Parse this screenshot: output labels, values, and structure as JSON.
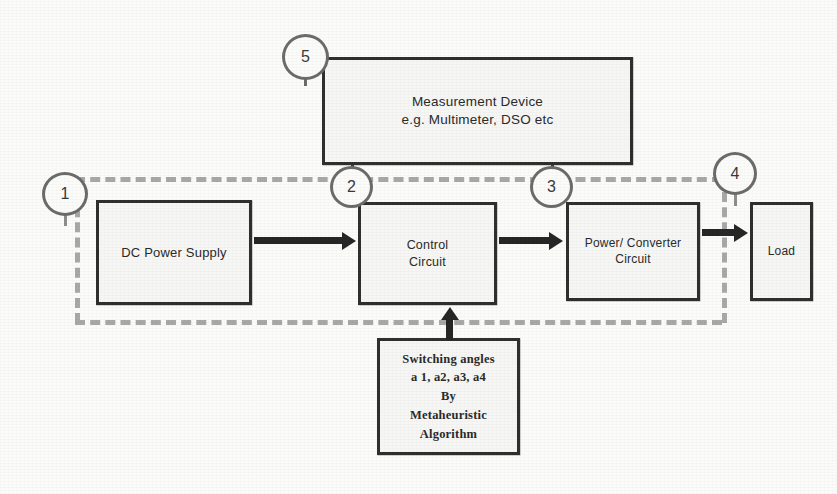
{
  "diagram": {
    "blocks": {
      "measurement": {
        "line1": "Measurement Device",
        "line2": "e.g. Multimeter, DSO etc",
        "marker": "5"
      },
      "dc_power_supply": {
        "line1": "DC Power Supply",
        "marker": "1"
      },
      "control_circuit": {
        "line1": "Control",
        "line2": "Circuit",
        "marker": "2"
      },
      "power_converter_circuit": {
        "line1": "Power/ Converter",
        "line2": "Circuit",
        "marker": "3"
      },
      "load": {
        "line1": "Load",
        "marker": "4"
      },
      "switching_angles": {
        "line1": "Switching angles",
        "line2": "a 1, a2, a3, a4",
        "line3": "By",
        "line4": "Metaheuristic",
        "line5": "Algorithm"
      }
    },
    "markers": {
      "one": "1",
      "two": "2",
      "three": "3",
      "four": "4",
      "five": "5"
    },
    "colors": {
      "box_border": "#2f2f2f",
      "box_fill": "#f6f6f4",
      "dashed_boundary": "#a8a8a8",
      "arrow": "#262626",
      "circle_border": "#6b6b6b",
      "background": "#fbfbfa"
    }
  }
}
